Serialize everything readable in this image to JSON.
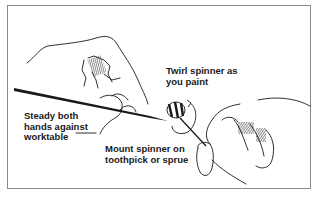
{
  "figure": {
    "callouts": [
      {
        "id": "twirl",
        "text": "Twirl spinner as\nyou paint"
      },
      {
        "id": "steady",
        "text": "Steady both\nhands against\nworktable"
      },
      {
        "id": "mount",
        "text": "Mount spinner on\ntoothpick or sprue"
      }
    ],
    "icons": {
      "left_hand": "hand-holding-brush-icon",
      "right_hand": "hand-holding-toothpick-icon",
      "brush": "paintbrush-icon",
      "spinner": "striped-spinner-icon",
      "rotation_arrow": "rotation-arrow-icon"
    },
    "colors": {
      "ink": "#1a1a1a",
      "frame": "#8a8a8a",
      "background": "#ffffff"
    }
  }
}
